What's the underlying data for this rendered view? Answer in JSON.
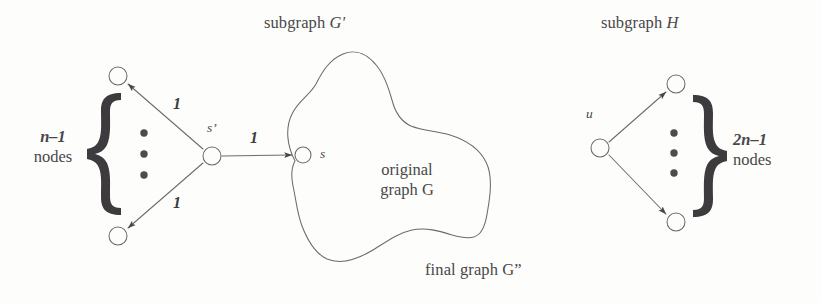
{
  "figure": {
    "type": "diagram",
    "background_color": "#fdfdfb",
    "ink_color": "#49474a",
    "width": 821,
    "height": 303
  },
  "captions": {
    "subgraph_gprime": {
      "plain": "subgraph ",
      "italic": "G'"
    },
    "subgraph_h": {
      "plain": "subgraph ",
      "italic": "H"
    },
    "final_graph": "final graph G”"
  },
  "left_group": {
    "brace_count": {
      "italic": "n–1",
      "plain": "nodes"
    },
    "brace_glyph": "{",
    "vertical_dots": "⋮",
    "hub_label": "s’",
    "edge_weight_top": "1",
    "edge_weight_bottom": "1",
    "edge_weight_right": "1",
    "nodes": [
      {
        "name": "top-node",
        "cx": 118,
        "cy": 76,
        "r": 9
      },
      {
        "name": "bottom-node",
        "cx": 118,
        "cy": 236,
        "r": 9
      },
      {
        "name": "hub-node-s-prime",
        "cx": 212,
        "cy": 156,
        "r": 9
      }
    ]
  },
  "blob": {
    "label_line1": "original",
    "label_line2": "graph G",
    "node_s_label": "s",
    "node_s": {
      "cx": 303,
      "cy": 155,
      "r": 8
    }
  },
  "right_group": {
    "source_label": "u",
    "brace_glyph": "}",
    "brace_count": {
      "italic": "2n–1",
      "plain": "nodes"
    },
    "vertical_dots": "⋮",
    "nodes": [
      {
        "name": "source-node-u",
        "cx": 600,
        "cy": 148,
        "r": 9
      },
      {
        "name": "top-node",
        "cx": 676,
        "cy": 84,
        "r": 9
      },
      {
        "name": "bottom-node",
        "cx": 676,
        "cy": 222,
        "r": 9
      }
    ]
  },
  "colors": {
    "ink": "#49474a",
    "brace_fill": "#3d3b3c",
    "stroke": "#6d6a6c"
  }
}
